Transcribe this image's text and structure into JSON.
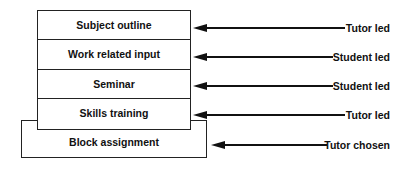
{
  "diagram": {
    "stack_items": [
      {
        "label": "Subject outline",
        "role": "Tutor led"
      },
      {
        "label": "Work related input",
        "role": "Student led"
      },
      {
        "label": "Seminar",
        "role": "Student led"
      },
      {
        "label": "Skills training",
        "role": "Tutor led"
      }
    ],
    "base_item": {
      "label": "Block assignment",
      "role": "Tutor chosen"
    },
    "arrow_icon": "left-arrow-icon"
  }
}
